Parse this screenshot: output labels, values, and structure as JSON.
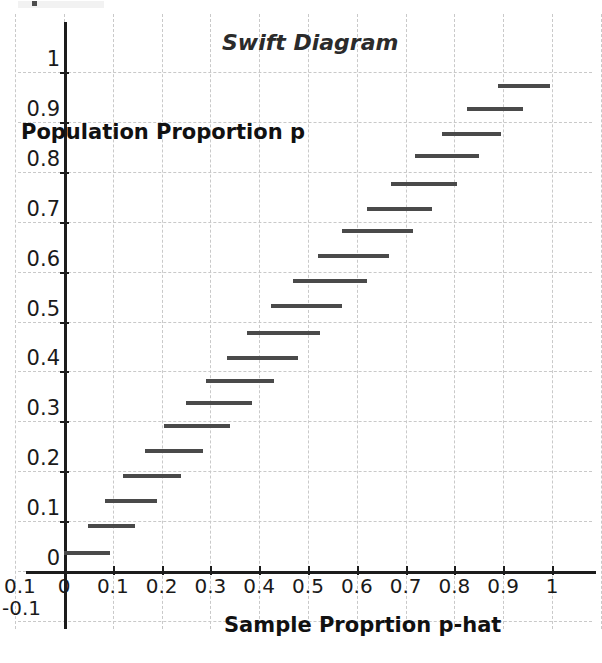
{
  "chart_data": {
    "type": "line",
    "title": "Swift Diagram",
    "xlabel": "Sample Proprtion p-hat",
    "ylabel": "Population Proportion p",
    "xlim": [
      -0.1,
      1.1
    ],
    "ylim": [
      -0.12,
      1.06
    ],
    "grid": true,
    "legend": "none",
    "xticks": [
      "0",
      "0.1",
      "0.2",
      "0.3",
      "0.4",
      "0.5",
      "0.6",
      "0.7",
      "0.8",
      "0.9",
      "1"
    ],
    "xtick_values": [
      0,
      0.1,
      0.2,
      0.3,
      0.4,
      0.5,
      0.6,
      0.7,
      0.8,
      0.9,
      1
    ],
    "yticks": [
      "0",
      "0.1",
      "0.2",
      "0.3",
      "0.4",
      "0.5",
      "0.6",
      "0.7",
      "0.8",
      "0.9",
      "1"
    ],
    "ytick_values": [
      0,
      0.1,
      0.2,
      0.3,
      0.4,
      0.5,
      0.6,
      0.7,
      0.8,
      0.9,
      1
    ],
    "stray_labels": [
      "0.1",
      "-0.1"
    ],
    "series_description": "Horizontal confidence interval segments: for each population proportion p, the interval of sample proportions p-hat covered.",
    "segments": [
      {
        "p": 0.04,
        "phat_low": 0.0,
        "phat_high": 0.095
      },
      {
        "p": 0.095,
        "phat_low": 0.05,
        "phat_high": 0.145
      },
      {
        "p": 0.145,
        "phat_low": 0.085,
        "phat_high": 0.19
      },
      {
        "p": 0.195,
        "phat_low": 0.12,
        "phat_high": 0.24
      },
      {
        "p": 0.245,
        "phat_low": 0.165,
        "phat_high": 0.285
      },
      {
        "p": 0.295,
        "phat_low": 0.205,
        "phat_high": 0.34
      },
      {
        "p": 0.34,
        "phat_low": 0.25,
        "phat_high": 0.385
      },
      {
        "p": 0.385,
        "phat_low": 0.29,
        "phat_high": 0.43
      },
      {
        "p": 0.43,
        "phat_low": 0.335,
        "phat_high": 0.48
      },
      {
        "p": 0.48,
        "phat_low": 0.375,
        "phat_high": 0.525
      },
      {
        "p": 0.535,
        "phat_low": 0.425,
        "phat_high": 0.57
      },
      {
        "p": 0.585,
        "phat_low": 0.47,
        "phat_high": 0.62
      },
      {
        "p": 0.635,
        "phat_low": 0.52,
        "phat_high": 0.665
      },
      {
        "p": 0.685,
        "phat_low": 0.57,
        "phat_high": 0.715
      },
      {
        "p": 0.73,
        "phat_low": 0.62,
        "phat_high": 0.755
      },
      {
        "p": 0.78,
        "phat_low": 0.67,
        "phat_high": 0.805
      },
      {
        "p": 0.835,
        "phat_low": 0.72,
        "phat_high": 0.85
      },
      {
        "p": 0.88,
        "phat_low": 0.775,
        "phat_high": 0.895
      },
      {
        "p": 0.93,
        "phat_low": 0.825,
        "phat_high": 0.94
      },
      {
        "p": 0.975,
        "phat_low": 0.89,
        "phat_high": 0.995
      }
    ]
  },
  "colors": {
    "segment": "#4a4a4a",
    "axis": "#1c1c1c",
    "grid": "#c9c9c9",
    "background": "#ffffff",
    "text": "#1a1a1a"
  }
}
